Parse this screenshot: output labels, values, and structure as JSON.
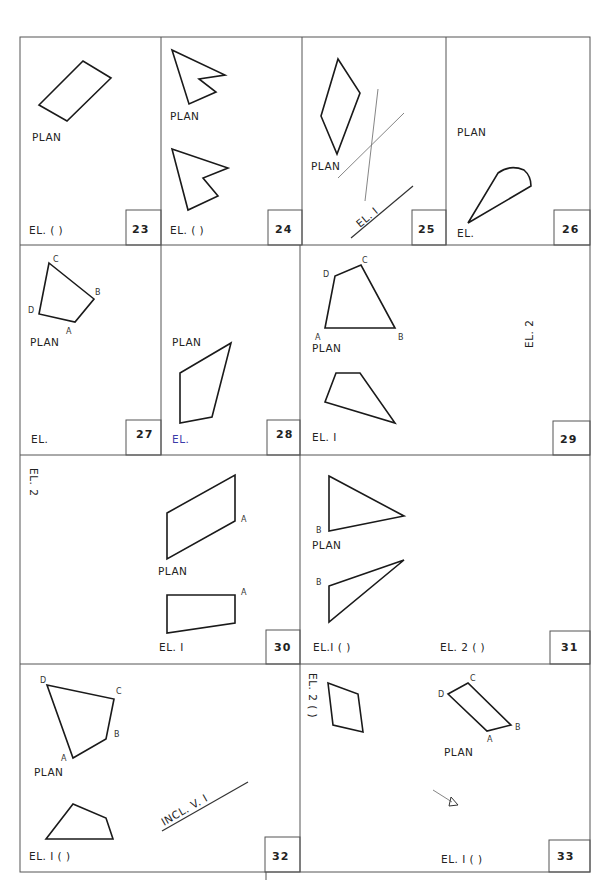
{
  "sheet": {
    "cells": [
      {
        "number": "23",
        "labels": {
          "plan": "PLAN",
          "elevation": "EL. (   )"
        }
      },
      {
        "number": "24",
        "labels": {
          "plan": "PLAN",
          "elevation": "EL. (   )"
        }
      },
      {
        "number": "25",
        "labels": {
          "plan": "PLAN",
          "ref_line": "EL. I"
        }
      },
      {
        "number": "26",
        "labels": {
          "plan": "PLAN",
          "elevation": "EL."
        }
      },
      {
        "number": "27",
        "labels": {
          "plan": "PLAN",
          "elevation": "EL."
        },
        "points": [
          "A",
          "B",
          "C",
          "D"
        ]
      },
      {
        "number": "28",
        "labels": {
          "plan": "PLAN",
          "elevation": "EL."
        }
      },
      {
        "number": "29",
        "labels": {
          "plan": "PLAN",
          "elevation1": "EL. I",
          "elevation2": "EL. 2"
        },
        "points": [
          "A",
          "B",
          "C",
          "D"
        ]
      },
      {
        "number": "30",
        "labels": {
          "plan": "PLAN",
          "elevation1": "EL. I",
          "elevation2": "EL. 2"
        },
        "points": [
          "A",
          "A"
        ]
      },
      {
        "number": "31",
        "labels": {
          "plan": "PLAN",
          "elevation1": "EL.I  (    )",
          "elevation2": "EL. 2 (    )"
        },
        "points": [
          "B",
          "B"
        ]
      },
      {
        "number": "32",
        "labels": {
          "plan": "PLAN",
          "elevation1": "EL. I (   )",
          "ref_line": "INCL. V. I"
        },
        "points": [
          "A",
          "B",
          "C",
          "D"
        ]
      },
      {
        "number": "33",
        "labels": {
          "plan": "PLAN",
          "elevation1": "EL. I (    )",
          "elevation2": "EL. 2 (   )"
        },
        "points": [
          "A",
          "B",
          "C",
          "D"
        ]
      }
    ]
  },
  "icons": {
    "view_direction_arrow": "arrow-icon"
  }
}
